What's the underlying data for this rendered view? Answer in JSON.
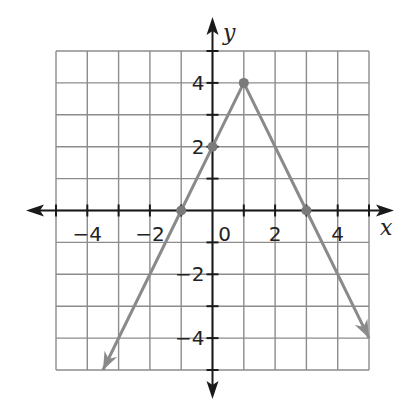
{
  "chart_data": {
    "type": "line",
    "title": "",
    "xlabel": "x",
    "ylabel": "y",
    "xlim": [
      -5,
      5
    ],
    "ylim": [
      -5,
      5
    ],
    "grid": true,
    "x_ticks": [
      -4,
      -2,
      0,
      2,
      4
    ],
    "y_ticks": [
      -4,
      -2,
      2,
      4
    ],
    "tick_labels": {
      "x": [
        "−4",
        "−2",
        "0",
        "2",
        "4"
      ],
      "y": [
        "−4",
        "−2",
        "2",
        "4"
      ]
    },
    "series": [
      {
        "name": "piecewise linear (inverted V)",
        "color": "#8a8a8a",
        "points": [
          [
            -3.5,
            -5
          ],
          [
            -1,
            0
          ],
          [
            0,
            2
          ],
          [
            1,
            4
          ],
          [
            3,
            0
          ],
          [
            5,
            -4
          ]
        ],
        "marked_points": [
          [
            -1,
            0
          ],
          [
            0,
            2
          ],
          [
            1,
            4
          ],
          [
            3,
            0
          ]
        ],
        "arrows": [
          "start",
          "end"
        ]
      }
    ],
    "vertex": [
      1,
      4
    ],
    "x_intercepts": [
      -1,
      3
    ],
    "y_intercept": 2
  },
  "labels": {
    "x_axis": "x",
    "y_axis": "y",
    "origin": "0"
  },
  "colors": {
    "axis": "#1a1a1a",
    "grid": "#8c8c8c",
    "line": "#8a8a8a",
    "point": "#7a7a7a"
  }
}
